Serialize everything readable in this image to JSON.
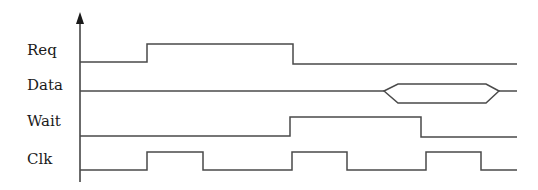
{
  "diagram": {
    "type": "timing-diagram",
    "colors": {
      "line": "#4a4a4a",
      "text": "#1a1a1a",
      "background": "#ffffff"
    },
    "axis": {
      "x": 80,
      "y_top": 12,
      "y_bottom": 182
    },
    "signals": [
      {
        "name": "Req",
        "label": "Req",
        "label_pos": [
          27,
          55
        ],
        "kind": "digital",
        "points": [
          [
            80,
            62
          ],
          [
            147,
            62
          ],
          [
            147,
            44
          ],
          [
            293,
            44
          ],
          [
            293,
            64
          ],
          [
            517,
            64
          ]
        ]
      },
      {
        "name": "Data",
        "label": "Data",
        "label_pos": [
          27,
          90
        ],
        "kind": "bus",
        "idle_y": 91,
        "line_start": 80,
        "line_end": 517,
        "bus_open": 384,
        "bus_open_full": 398,
        "bus_close_full": 486,
        "bus_close": 499,
        "bus_top": 84,
        "bus_bottom": 103
      },
      {
        "name": "Wait",
        "label": "Wait",
        "label_pos": [
          27,
          126
        ],
        "kind": "digital",
        "points": [
          [
            80,
            136
          ],
          [
            290,
            136
          ],
          [
            290,
            117
          ],
          [
            421,
            117
          ],
          [
            421,
            137
          ],
          [
            517,
            137
          ]
        ]
      },
      {
        "name": "Clk",
        "label": "Clk",
        "label_pos": [
          27,
          164
        ],
        "kind": "digital",
        "points": [
          [
            80,
            170
          ],
          [
            147,
            170
          ],
          [
            147,
            152
          ],
          [
            203,
            152
          ],
          [
            203,
            170
          ],
          [
            292,
            170
          ],
          [
            292,
            152
          ],
          [
            347,
            152
          ],
          [
            347,
            170
          ],
          [
            426,
            170
          ],
          [
            426,
            152
          ],
          [
            481,
            152
          ],
          [
            481,
            170
          ],
          [
            517,
            170
          ]
        ]
      }
    ]
  }
}
